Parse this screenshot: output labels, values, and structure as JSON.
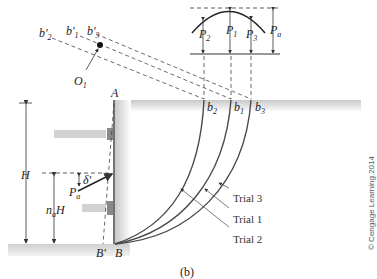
{
  "figure": {
    "caption": "(b)",
    "copyright": "© Cengage Learning 2014"
  },
  "labels": {
    "A": "A",
    "B": "B",
    "B_prime": "B'",
    "H": "H",
    "naH_n": "n",
    "naH_sub": "a",
    "naH_H": "H",
    "Pa_main": "P",
    "Pa_main_sub": "a",
    "delta": "δ'",
    "O1": "O",
    "O1_sub": "1",
    "b1": "b",
    "b1_sub": "1",
    "b2": "b",
    "b2_sub": "2",
    "b3": "b",
    "b3_sub": "3",
    "b1p": "b'",
    "b1p_sub": "1",
    "b2p": "b'",
    "b2p_sub": "2",
    "b3p": "b'",
    "b3p_sub": "3",
    "P1": "P",
    "P1_sub": "1",
    "P2": "P",
    "P2_sub": "2",
    "P3": "P",
    "P3_sub": "3",
    "Pa_curve": "P",
    "Pa_curve_sub": "a"
  },
  "trials": [
    {
      "label": "Trial 3"
    },
    {
      "label": "Trial 1"
    },
    {
      "label": "Trial 2"
    }
  ],
  "colors": {
    "ground": "#d9d9d9",
    "strut": "#d4d4d4",
    "strut_plate": "#8a8a8a",
    "curve": "#4a4a4a",
    "line": "#333333"
  }
}
